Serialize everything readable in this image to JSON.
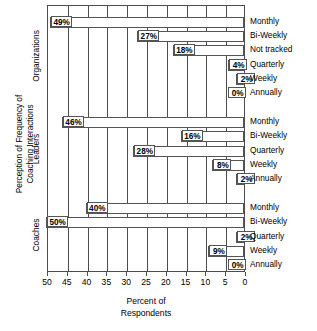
{
  "chart_data": {
    "type": "bar",
    "orientation": "horizontal",
    "title": "",
    "xlabel": "Percent of Respondents",
    "xlabel_lines": [
      "Percent of",
      "Respondents"
    ],
    "ylabel": "Perception of Frequency of Coaching Interactions",
    "ylabel_lines": [
      "Perception of Frequency of",
      "Coaching Interactions"
    ],
    "xlim": [
      0,
      50
    ],
    "x_axis_reversed": true,
    "xticks": [
      50,
      45,
      40,
      35,
      30,
      25,
      20,
      15,
      10,
      5,
      0
    ],
    "xtick_labels": [
      "50",
      "45",
      "40",
      "35",
      "30",
      "25",
      "20",
      "15",
      "10",
      "5",
      "0"
    ],
    "grid": true,
    "legend": "none",
    "value_suffix": "%",
    "groups": [
      {
        "name": "Organizations",
        "categories": [
          "Monthly",
          "Bi-Weekly",
          "Not tracked",
          "Quarterly",
          "Weekly",
          "Annually"
        ],
        "values": [
          49,
          27,
          18,
          4,
          2,
          0
        ],
        "value_labels": [
          "49%",
          "27%",
          "18%",
          "4%",
          "2%",
          "0%"
        ]
      },
      {
        "name": "Leaders",
        "categories": [
          "Monthly",
          "Bi-Weekly",
          "Quarterly",
          "Weekly",
          "Annually"
        ],
        "values": [
          46,
          16,
          28,
          8,
          2
        ],
        "value_labels": [
          "46%",
          "16%",
          "28%",
          "8%",
          "2%"
        ]
      },
      {
        "name": "Coaches",
        "categories": [
          "Monthly",
          "Bi-Weekly",
          "Quarterly",
          "Weekly",
          "Annually"
        ],
        "values": [
          40,
          50,
          2,
          9,
          0
        ],
        "value_labels": [
          "40%",
          "50%",
          "2%",
          "9%",
          "0%"
        ]
      }
    ]
  },
  "colors": {
    "axis": "#4d4d4d",
    "bar_border": "#545454",
    "bar_fill": "#ffffff",
    "text": "#000000",
    "background": "#ffffff"
  }
}
